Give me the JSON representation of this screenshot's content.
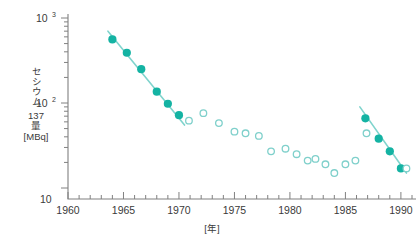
{
  "chart_data": {
    "type": "scatter",
    "title": "",
    "xlabel": "[年]",
    "ylabel_lines": [
      "セシウム",
      "137",
      "量",
      "[MBq]"
    ],
    "ylabel_vertical": "セシウム",
    "ylabel_row2": "137",
    "ylabel_row3": "量",
    "ylabel_row4": "[MBq]",
    "xlim": [
      1960,
      1991
    ],
    "ylim": [
      10,
      1000
    ],
    "yscale": "log",
    "xscale": "linear",
    "grid": false,
    "legend": "none",
    "x_ticks_major": [
      1960,
      1965,
      1970,
      1975,
      1980,
      1985,
      1990
    ],
    "x_ticklabels": [
      "1960",
      "1965",
      "1970",
      "1975",
      "1980",
      "1985",
      "1990"
    ],
    "x_tick_minor_step": 1,
    "y_ticks_major": [
      10,
      100,
      1000
    ],
    "y_ticklabels": [
      "10",
      "10^2",
      "10^3"
    ],
    "y_label_bottom": "10",
    "y_label_mid_base": "10",
    "y_label_mid_exp": "2",
    "y_label_top_base": "10",
    "y_label_top_exp": "3",
    "colors": {
      "filled_marker": "#14b3a3",
      "open_marker_stroke": "#7fd0cb",
      "fit_line": "#7fd4cd",
      "axis": "#808080",
      "text": "#3a3a3a",
      "background": "#ffffff"
    },
    "series": [
      {
        "name": "filled-early",
        "marker": "filled-circle",
        "points": [
          {
            "x": 1964.0,
            "y": 560
          },
          {
            "x": 1965.3,
            "y": 390
          },
          {
            "x": 1966.6,
            "y": 250
          },
          {
            "x": 1968.0,
            "y": 136
          },
          {
            "x": 1969.0,
            "y": 98
          },
          {
            "x": 1970.0,
            "y": 72
          }
        ]
      },
      {
        "name": "open-middle",
        "marker": "open-circle",
        "points": [
          {
            "x": 1970.9,
            "y": 62
          },
          {
            "x": 1972.2,
            "y": 76
          },
          {
            "x": 1973.6,
            "y": 58
          },
          {
            "x": 1975.0,
            "y": 46
          },
          {
            "x": 1976.0,
            "y": 44
          },
          {
            "x": 1977.2,
            "y": 41
          },
          {
            "x": 1978.3,
            "y": 27
          },
          {
            "x": 1979.6,
            "y": 29
          },
          {
            "x": 1980.6,
            "y": 25
          },
          {
            "x": 1981.6,
            "y": 21
          },
          {
            "x": 1982.3,
            "y": 22
          },
          {
            "x": 1983.2,
            "y": 19
          },
          {
            "x": 1984.0,
            "y": 15
          },
          {
            "x": 1985.0,
            "y": 19
          },
          {
            "x": 1985.9,
            "y": 21
          },
          {
            "x": 1986.9,
            "y": 44
          }
        ]
      },
      {
        "name": "filled-late",
        "marker": "filled-circle",
        "points": [
          {
            "x": 1986.8,
            "y": 66
          },
          {
            "x": 1988.0,
            "y": 38
          },
          {
            "x": 1989.0,
            "y": 27
          },
          {
            "x": 1990.0,
            "y": 17
          }
        ]
      },
      {
        "name": "open-late",
        "marker": "open-circle",
        "points": [
          {
            "x": 1990.5,
            "y": 17
          }
        ]
      }
    ],
    "fit_lines": [
      {
        "name": "fit-early",
        "x1": 1963.6,
        "y1": 700,
        "x2": 1970.5,
        "y2": 55
      },
      {
        "name": "fit-late",
        "x1": 1986.3,
        "y1": 90,
        "x2": 1990.5,
        "y2": 15
      }
    ]
  }
}
